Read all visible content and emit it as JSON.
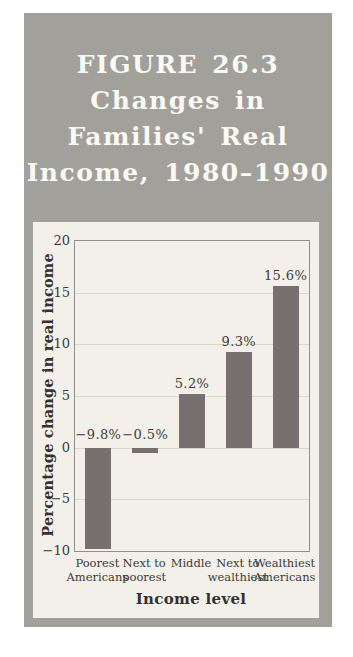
{
  "figure": {
    "title_lines": [
      "FIGURE 26.3",
      "Changes in",
      "Families' Real",
      "Income, 1980–1990"
    ]
  },
  "colors": {
    "card_bg": "#a2a09b",
    "panel_bg": "#f2f0e9",
    "bar": "#767170",
    "plot_border": "#8f8d87",
    "gridline": "#d8d5ca",
    "title_text": "#faf9f4",
    "text": "#3d3b37"
  },
  "chart_data": {
    "type": "bar",
    "title": "FIGURE 26.3 Changes in Families' Real Income, 1980–1990",
    "categories": [
      "Poorest\nAmericans",
      "Next to\npoorest",
      "Middle",
      "Next to\nwealthiest",
      "Wealthiest\nAmericans"
    ],
    "values": [
      -9.8,
      -0.5,
      5.2,
      9.3,
      15.6
    ],
    "bar_labels": [
      "−9.8%",
      "−0.5%",
      "5.2%",
      "9.3%",
      "15.6%"
    ],
    "xlabel": "Income level",
    "ylabel": "Percentage change in real income",
    "ylim": [
      -10,
      20
    ],
    "yticks": [
      20,
      15,
      10,
      5,
      0,
      -5,
      -10
    ],
    "ytick_labels": [
      "20",
      "15",
      "10",
      "5",
      "0",
      "−5",
      "−10"
    ],
    "grid": true,
    "legend": false
  }
}
